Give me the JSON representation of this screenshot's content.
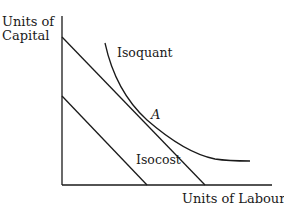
{
  "diagram": {
    "type": "isoquant-isocost",
    "y_axis_label": {
      "line1": "Units of",
      "line2": "Capital"
    },
    "x_axis_label": "Units of Labour",
    "curves": {
      "isoquant_label": "Isoquant",
      "isocost_label": "Isocost"
    },
    "tangent_point_label": "A",
    "colors": {
      "ink": "#1a1a1a",
      "background": "#ffffff"
    }
  }
}
